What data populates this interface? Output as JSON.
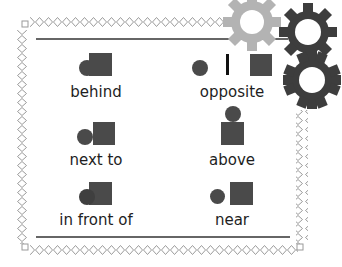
{
  "card": {
    "items": [
      {
        "label": "behind",
        "relation": "circle-behind-square"
      },
      {
        "label": "opposite",
        "relation": "circle-line-square"
      },
      {
        "label": "next to",
        "relation": "circle-touching-square"
      },
      {
        "label": "above",
        "relation": "circle-on-top-of-square"
      },
      {
        "label": "in front of",
        "relation": "circle-in-front-of-square"
      },
      {
        "label": "near",
        "relation": "circle-near-square"
      }
    ]
  },
  "colors": {
    "shape": "#4a4a4a",
    "gear_dark": "#3d3d3d",
    "gear_light": "#b3b3b3",
    "border": "#9a9a9a",
    "rule": "#666666"
  },
  "decorations": {
    "gears": [
      "light-gear",
      "dark-gear-top",
      "dark-gear-bottom"
    ]
  }
}
